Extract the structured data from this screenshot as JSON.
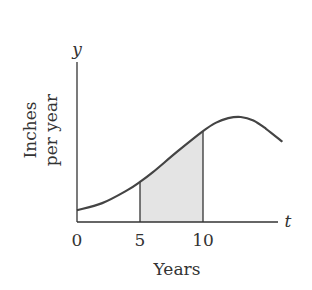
{
  "chart_data": {
    "type": "area",
    "title": "",
    "xlabel": "Years",
    "ylabel": "Inches per year",
    "ylabel_lines": [
      "Inches",
      "per year"
    ],
    "x_axis_var": "t",
    "y_axis_var": "y",
    "xlim": [
      0,
      16.6
    ],
    "ylim": [
      0,
      1
    ],
    "x_ticks": [
      0,
      5,
      10
    ],
    "x_tick_labels": [
      "0",
      "5",
      "10"
    ],
    "grid": false,
    "legend": "none",
    "curve": {
      "name": "rainfall-rate",
      "x": [
        0,
        2,
        4,
        5,
        6,
        8,
        10,
        11,
        12,
        13,
        14,
        15,
        16.3
      ],
      "y": [
        0.1,
        0.16,
        0.27,
        0.34,
        0.42,
        0.6,
        0.77,
        0.84,
        0.88,
        0.89,
        0.86,
        0.79,
        0.68
      ]
    },
    "shaded_region": {
      "from": 5,
      "to": 10,
      "color": "#e4e4e4"
    },
    "colors": {
      "curve": "#444444",
      "axis": "#333333",
      "fill": "#e4e4e4"
    }
  }
}
